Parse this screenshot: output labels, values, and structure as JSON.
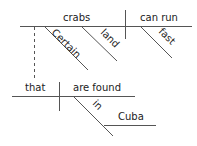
{
  "diagram": {
    "type": "sentence-diagram",
    "main_clause": {
      "subject": "crabs",
      "verb": "can run",
      "modifiers": {
        "subject": [
          "Certain",
          "land"
        ],
        "verb": [
          "fast"
        ]
      }
    },
    "relative_clause": {
      "subject": "that",
      "verb": "are found",
      "preposition": "in",
      "object": "Cuba"
    },
    "colors": {
      "line": "#555555",
      "text": "#222222"
    }
  }
}
